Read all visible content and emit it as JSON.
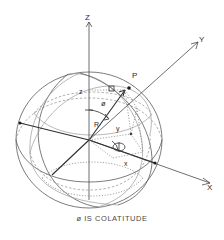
{
  "figure": {
    "title": "",
    "caption": "ø IS COLATITUDE",
    "type": "spherical-coordinate-diagram",
    "background_color": "#ffffff",
    "line_color": "#3a3a3a",
    "dashed_color": "#8e8e8e"
  },
  "axes": [
    {
      "id": "z",
      "label": "Z",
      "direction": "up"
    },
    {
      "id": "y",
      "label": "Y",
      "direction": "upper-right"
    },
    {
      "id": "x",
      "label": "X",
      "direction": "lower-right"
    }
  ],
  "points": [
    {
      "id": "P",
      "label": "P",
      "description": "point on sphere surface"
    }
  ],
  "segments": [
    {
      "id": "R",
      "label": "R",
      "description": "radius from origin to point P"
    },
    {
      "id": "z",
      "label": "z",
      "description": "height of P above xy-plane"
    },
    {
      "id": "y",
      "label": "y",
      "description": "y component of P projection"
    },
    {
      "id": "x",
      "label": "x",
      "description": "x component of P projection"
    }
  ],
  "angles": [
    {
      "id": "phi",
      "label": "ø",
      "description": "colatitude, angle from Z axis to R"
    },
    {
      "id": "theta",
      "label": "Φ",
      "description": "azimuth, angle in xy-plane from X axis"
    }
  ],
  "sphere": {
    "center": {
      "x": 89,
      "y": 140
    },
    "radius_x": 73,
    "radius_y": 68
  }
}
